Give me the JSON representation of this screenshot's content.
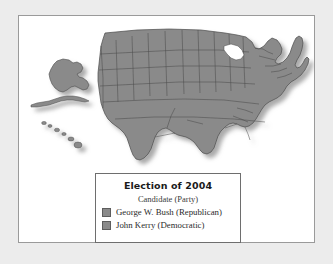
{
  "figure": {
    "background_color": "#ececec",
    "card_background": "#ffffff",
    "card_border_color": "#9a9a9a"
  },
  "map": {
    "name": "united-states-electoral-map",
    "fill_color": "#8a8a8a",
    "border_color": "#4a4a4a",
    "shadow_color": "#b9b9b9",
    "insets": [
      {
        "name": "alaska-inset",
        "label": "Alaska"
      },
      {
        "name": "hawaii-inset",
        "label": "Hawaii"
      }
    ]
  },
  "legend": {
    "title": "Election of 2004",
    "subtitle": "Candidate (Party)",
    "border_color": "#6e6e6e",
    "entries": [
      {
        "label": "George W. Bush (Republican)",
        "swatch_color": "#8a8a8a",
        "swatch_border": "#5d5d5d"
      },
      {
        "label": "John Kerry (Democratic)",
        "swatch_color": "#8a8a8a",
        "swatch_border": "#5d5d5d"
      }
    ]
  }
}
